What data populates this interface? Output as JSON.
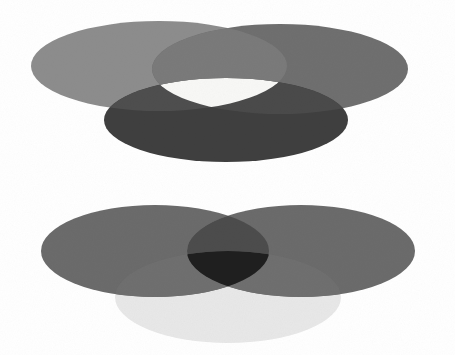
{
  "page": {
    "background_color": "#ffffff",
    "width": 455,
    "height": 355
  },
  "chart_data": {
    "type": "venn",
    "grid": false,
    "legend": false,
    "axis_labels": false,
    "diagrams": [
      {
        "name": "upper-venn",
        "label": "Upper Venn Diagram",
        "center_fill": "#f7f7f5",
        "sets": [
          {
            "id": "upper-left",
            "label": "Upper Left Set",
            "cx": 159,
            "cy": 66,
            "rx": 128,
            "ry": 45,
            "fill": "#8d8d8d",
            "opacity": 1
          },
          {
            "id": "upper-right",
            "label": "Upper Right Set",
            "cx": 280,
            "cy": 69,
            "rx": 128,
            "ry": 45,
            "fill": "#6f6f6f",
            "opacity": 1
          },
          {
            "id": "upper-bottom",
            "label": "Upper Bottom Set",
            "cx": 226,
            "cy": 120,
            "rx": 122,
            "ry": 42,
            "fill": "#4e4e4e",
            "opacity": 1
          }
        ],
        "regions": [
          {
            "id": "upper-left-only",
            "label": "Upper left only",
            "fill": "#8d8d8d"
          },
          {
            "id": "upper-right-only",
            "label": "Upper right only",
            "fill": "#6f6f6f"
          },
          {
            "id": "upper-bottom-only",
            "label": "Upper bottom only",
            "fill": "#3f3f3f"
          },
          {
            "id": "upper-left-right",
            "label": "Upper left and right overlap",
            "fill": "#7a7a7a"
          },
          {
            "id": "upper-left-bottom",
            "label": "Upper left and bottom overlap",
            "fill": "#4e4e4e"
          },
          {
            "id": "upper-right-bottom",
            "label": "Upper right and bottom overlap",
            "fill": "#4a4a4a"
          },
          {
            "id": "upper-triple",
            "label": "Upper triple overlap (light center)",
            "fill": "#f8f8f6"
          }
        ]
      },
      {
        "name": "lower-venn",
        "label": "Lower Venn Diagram",
        "center_fill": "#1c1c1c",
        "sets": [
          {
            "id": "lower-left",
            "label": "Lower Left Set",
            "cx": 155,
            "cy": 251,
            "rx": 114,
            "ry": 46,
            "fill": "#6b6b6b",
            "opacity": 1
          },
          {
            "id": "lower-right",
            "label": "Lower Right Set",
            "cx": 301,
            "cy": 251,
            "rx": 114,
            "ry": 46,
            "fill": "#6b6b6b",
            "opacity": 1
          },
          {
            "id": "lower-bottom",
            "label": "Lower Bottom Set",
            "cx": 228,
            "cy": 297,
            "rx": 113,
            "ry": 46,
            "fill": "#e6e6e6",
            "opacity": 1
          }
        ],
        "regions": [
          {
            "id": "lower-left-only",
            "label": "Lower left only",
            "fill": "#6b6b6b"
          },
          {
            "id": "lower-right-only",
            "label": "Lower right only",
            "fill": "#6b6b6b"
          },
          {
            "id": "lower-bottom-only",
            "label": "Lower bottom only",
            "fill": "#e8e8e8"
          },
          {
            "id": "lower-left-right",
            "label": "Lower left and right overlap",
            "fill": "#4c4c4c"
          },
          {
            "id": "lower-left-bottom",
            "label": "Lower left and bottom overlap",
            "fill": "#6f6f6f"
          },
          {
            "id": "lower-right-bottom",
            "label": "Lower right and bottom overlap",
            "fill": "#6f6f6f"
          },
          {
            "id": "lower-triple",
            "label": "Lower triple overlap (dark center)",
            "fill": "#1f1f1f"
          }
        ]
      }
    ]
  }
}
